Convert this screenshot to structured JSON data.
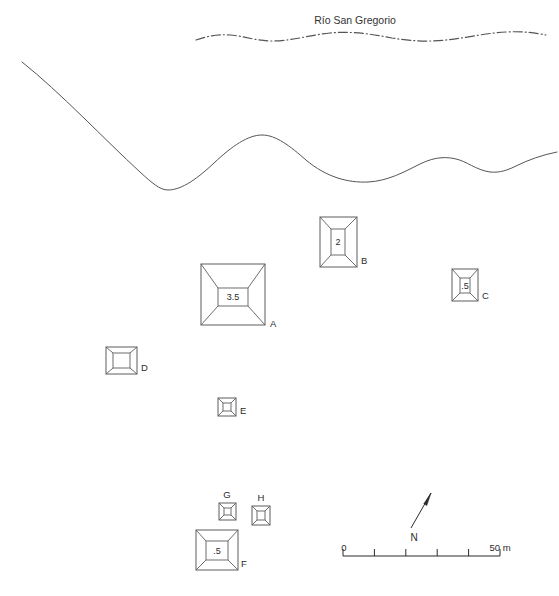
{
  "figure": {
    "type": "archaeological-site-plan",
    "river_label": "Río San Gregorio",
    "north_label": "N",
    "scale": {
      "start_label": "0",
      "end_label": "50 m",
      "ticks": 5,
      "unit": "m",
      "length_value": 50
    }
  },
  "structures": [
    {
      "id": "A",
      "label": "A",
      "height_label": "3.5",
      "shape": "square-pyramid",
      "x": 201,
      "y": 264,
      "w": 64,
      "h": 61,
      "inner_x": 218,
      "inner_y": 288,
      "inner_w": 30,
      "inner_h": 18,
      "label_x": 270,
      "label_y": 327,
      "label_anchor": "start"
    },
    {
      "id": "B",
      "label": "B",
      "height_label": "2",
      "shape": "rectangular-platform",
      "x": 320,
      "y": 217,
      "w": 37,
      "h": 50,
      "inner_x": 331,
      "inner_y": 229,
      "inner_w": 14,
      "inner_h": 26,
      "label_x": 361,
      "label_y": 264,
      "label_anchor": "start"
    },
    {
      "id": "C",
      "label": "C",
      "height_label": ".5",
      "shape": "rectangular-platform",
      "x": 452,
      "y": 269,
      "w": 26,
      "h": 32,
      "inner_x": 460,
      "inner_y": 278,
      "inner_w": 10,
      "inner_h": 15,
      "label_x": 482,
      "label_y": 299,
      "label_anchor": "start"
    },
    {
      "id": "D",
      "label": "D",
      "height_label": "",
      "shape": "rectangular-platform",
      "x": 106,
      "y": 347,
      "w": 31,
      "h": 27,
      "inner_x": 113,
      "inner_y": 353,
      "inner_w": 17,
      "inner_h": 15,
      "label_x": 141,
      "label_y": 371,
      "label_anchor": "start"
    },
    {
      "id": "E",
      "label": "E",
      "height_label": "",
      "shape": "rectangular-platform",
      "x": 218,
      "y": 398,
      "w": 18,
      "h": 18,
      "inner_x": 223,
      "inner_y": 403,
      "inner_w": 8,
      "inner_h": 8,
      "label_x": 240,
      "label_y": 414,
      "label_anchor": "start"
    },
    {
      "id": "F",
      "label": "F",
      "height_label": ".5",
      "shape": "square-pyramid",
      "x": 196,
      "y": 530,
      "w": 42,
      "h": 40,
      "inner_x": 206,
      "inner_y": 541,
      "inner_w": 22,
      "inner_h": 19,
      "label_x": 241,
      "label_y": 567,
      "label_anchor": "start"
    },
    {
      "id": "G",
      "label": "G",
      "height_label": "",
      "shape": "rectangular-platform",
      "x": 219,
      "y": 503,
      "w": 17,
      "h": 17,
      "inner_x": 224,
      "inner_y": 508,
      "inner_w": 7,
      "inner_h": 7,
      "label_x": 227,
      "label_y": 498,
      "label_anchor": "middle"
    },
    {
      "id": "H",
      "label": "H",
      "height_label": "",
      "shape": "rectangular-platform",
      "x": 252,
      "y": 506,
      "w": 18,
      "h": 19,
      "inner_x": 257,
      "inner_y": 511,
      "inner_w": 8,
      "inner_h": 9,
      "label_x": 261,
      "label_y": 501,
      "label_anchor": "middle"
    }
  ],
  "geometry": {
    "river_path": "M 196 40 C 208 36 218 34 230 35 C 244 36 256 41 272 41 C 292 41 310 35 330 33 C 352 31 372 34 392 38 C 410 41 428 42 446 40 C 466 38 486 33 506 32 C 522 31 536 33 546 35",
    "river_title_x": 355,
    "river_title_y": 24,
    "contour_path": "M 22 62 C 60 92 105 140 140 172 C 152 183 160 190 168 190 C 182 190 198 178 214 163 C 232 146 248 135 262 135 C 276 135 290 146 306 160 C 326 177 348 183 368 182 C 388 181 404 172 420 164 C 436 156 448 157 456 159 C 466 161 476 170 490 172 C 500 173 508 170 516 166 C 528 160 542 155 557 152",
    "scale_bar": {
      "x": 343,
      "y": 556,
      "width": 157,
      "tick_count": 5,
      "tick_height": 7,
      "label_y": 551,
      "start_label_x": 344,
      "end_label_x": 500
    },
    "north_arrow": {
      "tail_x": 411,
      "tail_y": 528,
      "tip_x": 431,
      "tip_y": 493,
      "label_x": 414,
      "label_y": 541
    }
  }
}
